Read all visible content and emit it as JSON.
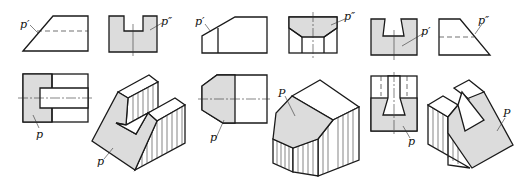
{
  "figure": {
    "colors": {
      "line": "#1a1a1a",
      "shade": "#dcdcdc",
      "background": "#ffffff"
    },
    "labels": {
      "v1": "p′",
      "v2": "p″",
      "v3": "p′",
      "v4": "p″",
      "v5": "p′",
      "v6": "p″",
      "b1": "p",
      "b2": "p",
      "b3": "p",
      "b4": "P",
      "b5": "p",
      "b6": "P"
    }
  }
}
